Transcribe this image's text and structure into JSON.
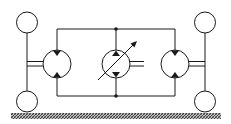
{
  "diagram": {
    "title": "Hydrostatic drive circuit",
    "colors": {
      "line": "#1a1a1a",
      "background": "#ffffff",
      "ground": "#555555"
    },
    "components": [
      {
        "id": "wheel-left-top",
        "type": "wheel"
      },
      {
        "id": "wheel-left-bottom",
        "type": "wheel"
      },
      {
        "id": "motor-left",
        "type": "hydraulic-motor"
      },
      {
        "id": "pump-center",
        "type": "variable-displacement-pump"
      },
      {
        "id": "motor-right",
        "type": "hydraulic-motor"
      },
      {
        "id": "wheel-right-top",
        "type": "wheel"
      },
      {
        "id": "wheel-right-bottom",
        "type": "wheel"
      },
      {
        "id": "ground",
        "type": "ground-hatch"
      }
    ]
  }
}
